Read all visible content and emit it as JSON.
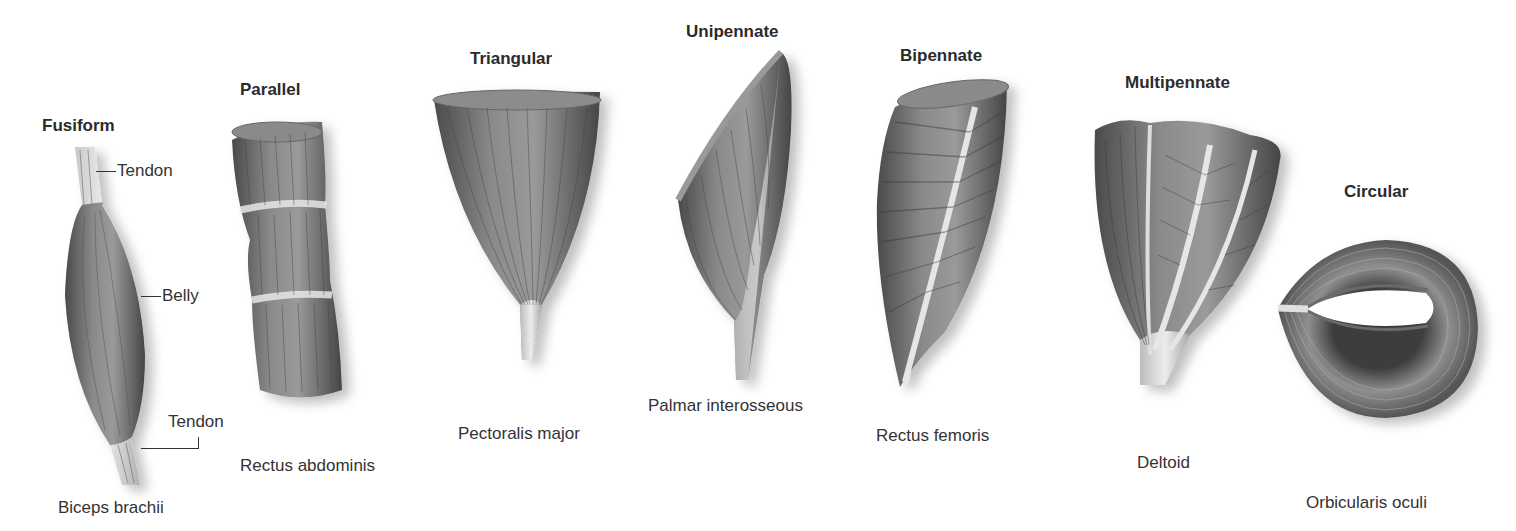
{
  "diagram": {
    "type": "muscle-fascicle-arrangement",
    "muscle_color": "#7a7a7a",
    "tendon_color": "#d9d9d9",
    "muscles": [
      {
        "shape": "Fusiform",
        "example": "Biceps brachii",
        "callouts": [
          "Tendon",
          "Belly",
          "Tendon"
        ]
      },
      {
        "shape": "Parallel",
        "example": "Rectus abdominis"
      },
      {
        "shape": "Triangular",
        "example": "Pectoralis major"
      },
      {
        "shape": "Unipennate",
        "example": "Palmar interosseous"
      },
      {
        "shape": "Bipennate",
        "example": "Rectus femoris"
      },
      {
        "shape": "Multipennate",
        "example": "Deltoid"
      },
      {
        "shape": "Circular",
        "example": "Orbicularis oculi"
      }
    ]
  }
}
